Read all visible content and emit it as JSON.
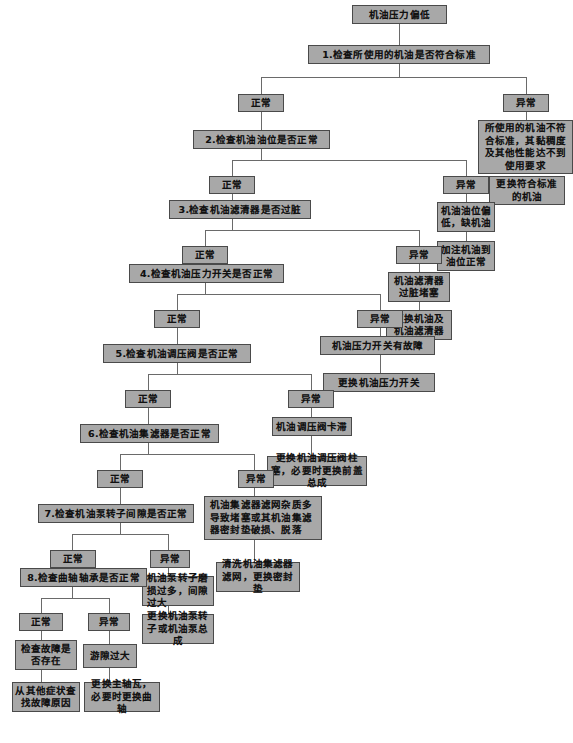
{
  "labels": {
    "normal": "正常",
    "abnormal": "异常"
  },
  "caption": "",
  "colors": {
    "node_fill": "#a8a8a8",
    "node_border": "#4a4a4a",
    "line": "#6a6a6a",
    "page_bg": "#ffffff",
    "text": "#111111"
  },
  "nodes": {
    "start": "机油压力偏低",
    "step1": "1.检查所使用的机油是否符合标准",
    "step1_normal": "正常",
    "step1_abnormal": "异常",
    "step1_abnormal_cause": "所使用的机油不符合标准，其黏稠度及其他性能达不到使用要求",
    "step1_abnormal_action": "更换符合标准的机油",
    "step2": "2.检查机油油位是否正常",
    "step2_normal": "正常",
    "step2_abnormal": "异常",
    "step2_abnormal_cause": "机油油位偏低，缺机油",
    "step2_abnormal_action": "加注机油到油位正常",
    "step3": "3.检查机油滤清器是否过脏",
    "step3_normal": "正常",
    "step3_abnormal": "异常",
    "step3_abnormal_cause": "机油滤清器过脏堵塞",
    "step3_abnormal_action": "更换机油及机油滤清器",
    "step4": "4.检查机油压力开关是否正常",
    "step4_normal": "正常",
    "step4_abnormal": "异常",
    "step4_abnormal_cause": "机油压力开关有故障",
    "step4_abnormal_action": "更换机油压力开关",
    "step5": "5.检查机油调压阀是否正常",
    "step5_normal": "正常",
    "step5_abnormal": "异常",
    "step5_abnormal_cause": "机油调压阀卡滞",
    "step5_abnormal_action": "更换机油调压阀柱塞，必要时更换前盖总成",
    "step6": "6.检查机油集滤器是否正常",
    "step6_normal": "正常",
    "step6_abnormal": "异常",
    "step6_abnormal_cause": "机油集滤器滤网杂质多导致堵塞或其机油集滤器密封垫破损、脱落",
    "step6_abnormal_action": "清洗机油集滤器滤网，更换密封垫",
    "step7": "7.检查机油泵转子间隙是否正常",
    "step7_normal": "正常",
    "step7_abnormal": "异常",
    "step7_abnormal_cause": "机油泵转子磨损过多，间隙过大",
    "step7_abnormal_action": "更换机油泵转子或机油泵总成",
    "step8": "8.检查曲轴轴承是否正常",
    "step8_normal": "正常",
    "step8_abnormal": "异常",
    "step8_normal_cause": "检查故障是否存在",
    "step8_normal_action": "从其他症状查找故障原因",
    "step8_abnormal_cause": "游隙过大",
    "step8_abnormal_action": "更换主轴瓦，必要时更换曲轴"
  }
}
